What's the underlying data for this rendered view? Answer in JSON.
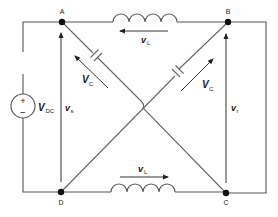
{
  "diagram": {
    "type": "circuit-schematic",
    "nodes": [
      {
        "id": "A",
        "label": "A"
      },
      {
        "id": "B",
        "label": "B"
      },
      {
        "id": "C",
        "label": "C"
      },
      {
        "id": "D",
        "label": "D"
      }
    ],
    "source": {
      "symbol_plus": "+",
      "symbol_minus": "−",
      "label_main": "V",
      "label_sub": "DC"
    },
    "voltages": {
      "vs": {
        "main": "v",
        "sub": "s"
      },
      "vr": {
        "main": "v",
        "sub": "r"
      },
      "vl_top": {
        "main": "v",
        "sub": "L"
      },
      "vl_bottom": {
        "main": "v",
        "sub": "L"
      },
      "vc_left": {
        "main": "V",
        "sub": "C"
      },
      "vc_right": {
        "main": "V",
        "sub": "C"
      }
    },
    "components": [
      {
        "type": "inductor",
        "between": [
          "A",
          "B"
        ],
        "arrow_direction": "left"
      },
      {
        "type": "inductor",
        "between": [
          "D",
          "C"
        ],
        "arrow_direction": "right"
      },
      {
        "type": "capacitor",
        "between": [
          "A",
          "C"
        ],
        "arrow_direction": "toward-A"
      },
      {
        "type": "capacitor",
        "between": [
          "D",
          "B"
        ],
        "arrow_direction": "toward-B"
      },
      {
        "type": "dc-source",
        "between": [
          "A",
          "D"
        ]
      }
    ],
    "colors": {
      "wire": "#555555",
      "node": "#111111",
      "background": "#ffffff"
    }
  }
}
